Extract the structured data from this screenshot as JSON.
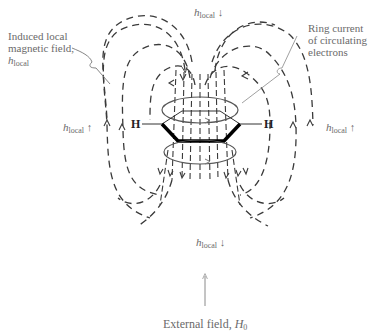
{
  "diagram": {
    "labels": {
      "induced_field": [
        "Induced local",
        "magnetic field,"
      ],
      "h_symbol": "h",
      "h_subscript": "local",
      "ring_current": [
        "Ring current",
        "of circulating",
        "electrons"
      ],
      "external_field_text": "External field, ",
      "external_field_symbol": "H",
      "external_field_subscript": "0",
      "hydrogen": "H",
      "arrow_up": "↑",
      "arrow_down": "↓"
    },
    "colors": {
      "field_lines": "#3a3a3a",
      "ring": "#555555",
      "benzene_bond": "#000000",
      "label_text": "#6a6a6a",
      "external_arrow": "#8a8a8a"
    }
  }
}
